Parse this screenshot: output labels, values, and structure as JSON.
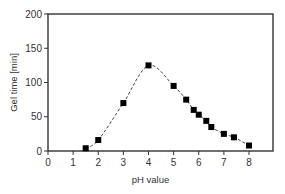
{
  "chart_data": {
    "type": "scatter",
    "title": "",
    "xlabel": "pH value",
    "ylabel": "Gel time [min]",
    "xlim": [
      0,
      8
    ],
    "ylim": [
      0,
      200
    ],
    "x_ticks": [
      0,
      1,
      2,
      3,
      4,
      5,
      6,
      7,
      8
    ],
    "y_ticks": [
      0,
      50,
      100,
      150,
      200
    ],
    "grid": false,
    "legend": null,
    "series": [
      {
        "name": "Gel time",
        "marker": "square",
        "color": "#000000",
        "trendline": "dashed",
        "x": [
          1.5,
          2.0,
          3.0,
          4.0,
          5.0,
          5.5,
          5.8,
          6.0,
          6.3,
          6.5,
          7.0,
          7.4,
          8.0
        ],
        "y": [
          4,
          16,
          70,
          125,
          95,
          75,
          60,
          53,
          44,
          35,
          25,
          20,
          8
        ]
      }
    ]
  },
  "colors": {
    "axis": "#333333",
    "marker": "#000000",
    "trend": "#444444"
  }
}
